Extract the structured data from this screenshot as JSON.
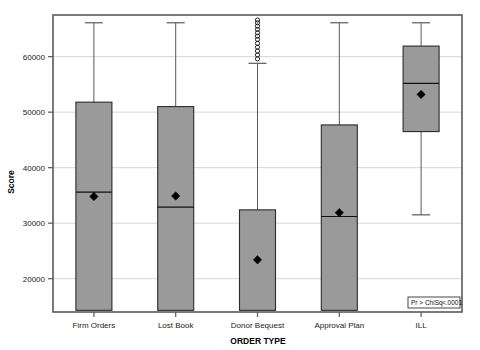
{
  "chart_data": {
    "type": "box",
    "title": "",
    "xlabel": "ORDER TYPE",
    "ylabel": "Score",
    "ylim": [
      14000,
      67500
    ],
    "yticks": [
      20000,
      30000,
      40000,
      50000,
      60000
    ],
    "ytick_labels": [
      "20000",
      "30000",
      "40000",
      "50000",
      "60000"
    ],
    "grid": true,
    "legend": "none",
    "categories": [
      "Firm Orders",
      "Lost Book",
      "Donor Bequest",
      "Approval Plan",
      "ILL"
    ],
    "boxes": [
      {
        "category": "Firm Orders",
        "whisker_low": 14300,
        "q1": 14300,
        "median": 35600,
        "mean": 34800,
        "q3": 51800,
        "whisker_high": 66100,
        "outliers": []
      },
      {
        "category": "Lost Book",
        "whisker_low": 14300,
        "q1": 14300,
        "median": 32900,
        "mean": 34900,
        "q3": 51000,
        "whisker_high": 66100,
        "outliers": []
      },
      {
        "category": "Donor Bequest",
        "whisker_low": 14300,
        "q1": 14300,
        "median": 14300,
        "mean": 23400,
        "q3": 32400,
        "whisker_high": 58800,
        "outliers": [
          59600,
          60300,
          61000,
          61700,
          62400,
          63100,
          63700,
          64300,
          64900,
          65500,
          66100,
          66600
        ]
      },
      {
        "category": "Approval Plan",
        "whisker_low": 14300,
        "q1": 14300,
        "median": 31200,
        "mean": 31900,
        "q3": 47700,
        "whisker_high": 66100,
        "outliers": []
      },
      {
        "category": "ILL",
        "whisker_low": 31500,
        "q1": 46500,
        "median": 55200,
        "mean": 53200,
        "q3": 61900,
        "whisker_high": 66100,
        "outliers": []
      }
    ],
    "annotation": {
      "label": "Pr > ChiSq",
      "value": "<.0001"
    }
  }
}
